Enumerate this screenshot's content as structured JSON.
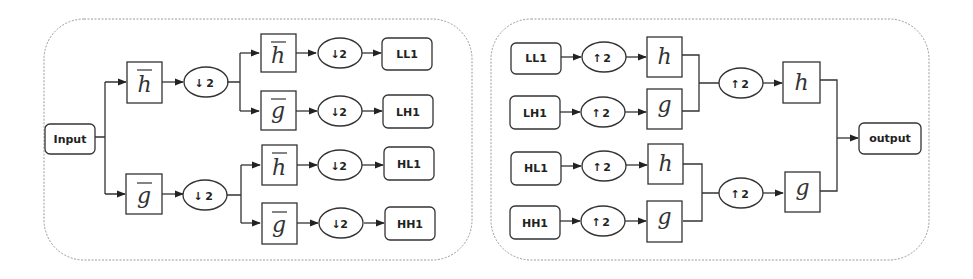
{
  "figure": {
    "left_panel": {
      "title": "decomposition",
      "input_label": "Input",
      "stage1": [
        {
          "filter": "h",
          "overline": true,
          "op": "2",
          "op_dir": "down"
        },
        {
          "filter": "g",
          "overline": true,
          "op": "2",
          "op_dir": "down"
        }
      ],
      "stage2": [
        {
          "filter": "h",
          "overline": true,
          "op": "2",
          "op_dir": "down",
          "output": "LL1"
        },
        {
          "filter": "g",
          "overline": true,
          "op": "2",
          "op_dir": "down",
          "output": "LH1"
        },
        {
          "filter": "h",
          "overline": true,
          "op": "2",
          "op_dir": "down",
          "output": "HL1"
        },
        {
          "filter": "g",
          "overline": true,
          "op": "2",
          "op_dir": "down",
          "output": "HH1"
        }
      ]
    },
    "right_panel": {
      "title": "reconstruction",
      "stage1": [
        {
          "input": "LL1",
          "op": "2",
          "op_dir": "up",
          "filter": "h"
        },
        {
          "input": "LH1",
          "op": "2",
          "op_dir": "up",
          "filter": "g"
        },
        {
          "input": "HL1",
          "op": "2",
          "op_dir": "up",
          "filter": "h"
        },
        {
          "input": "HH1",
          "op": "2",
          "op_dir": "up",
          "filter": "g"
        }
      ],
      "stage2": [
        {
          "op": "2",
          "op_dir": "up",
          "filter": "h"
        },
        {
          "op": "2",
          "op_dir": "up",
          "filter": "g"
        }
      ],
      "output_label": "output"
    },
    "colors": {
      "stroke": "#333333",
      "dashed_border": "#9a9a9a",
      "background": "#ffffff"
    }
  }
}
